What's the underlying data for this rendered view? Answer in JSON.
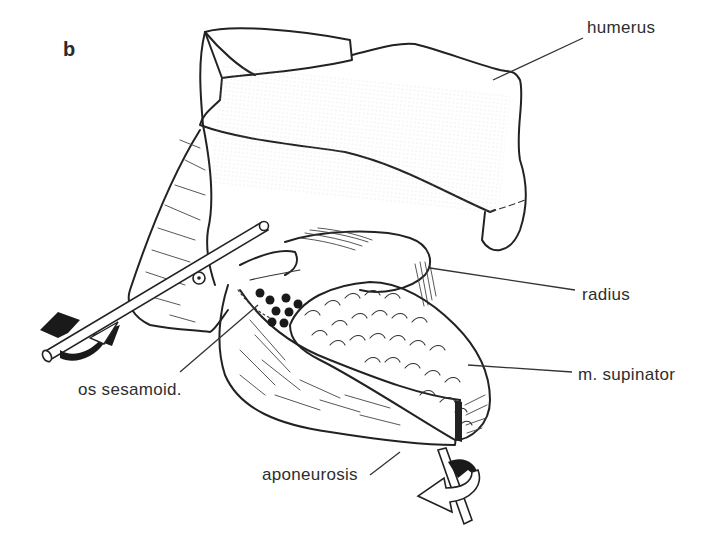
{
  "figure": {
    "panel_label": "b",
    "labels": {
      "humerus": "humerus",
      "radius": "radius",
      "m_supinator": "m. supinator",
      "os_sesamoid": "os sesamoid.",
      "aponeurosis": "aponeurosis"
    },
    "icons": {
      "left_arrow": "rotation-arrow-icon",
      "bottom_arrow": "rotation-arrow-icon",
      "circle_marker": "target-circle-icon"
    }
  }
}
